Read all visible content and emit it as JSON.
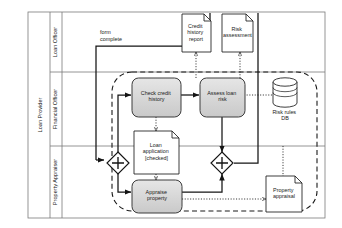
{
  "diagram": {
    "type": "bpmn-process-diagram",
    "pool": {
      "name": "Loan Provider"
    },
    "lanes": [
      {
        "id": "lane-loan-officer",
        "label": "Loan Officer"
      },
      {
        "id": "lane-financial-officer",
        "label": "Financial Officer"
      },
      {
        "id": "lane-property-appraiser",
        "label": "Property Appraiser"
      }
    ],
    "tasks": [
      {
        "id": "task-check-credit-history",
        "label": "Check credit history",
        "lane": "lane-financial-officer"
      },
      {
        "id": "task-assess-loan-risk",
        "label": "Assess loan risk",
        "lane": "lane-financial-officer"
      },
      {
        "id": "task-appraise-property",
        "label": "Appraise property",
        "lane": "lane-property-appraiser"
      }
    ],
    "data_objects": [
      {
        "id": "data-credit-history-report",
        "label": "Credit history report"
      },
      {
        "id": "data-risk-assessment",
        "label": "Risk assessment"
      },
      {
        "id": "data-loan-application-checked",
        "label": "Loan application [checked]"
      },
      {
        "id": "data-property-appraisal",
        "label": "Property appraisal"
      }
    ],
    "data_stores": [
      {
        "id": "datastore-risk-rules-db",
        "label": "Risk rules DB"
      }
    ],
    "gateways": [
      {
        "id": "gateway-parallel-split",
        "kind": "parallel",
        "symbol": "+"
      },
      {
        "id": "gateway-parallel-join",
        "kind": "parallel",
        "symbol": "+"
      }
    ],
    "flow_labels": [
      {
        "id": "flow-form-complete",
        "line1": "form",
        "line2": "complete"
      }
    ],
    "colors": {
      "task_fill": "#d9d9d9",
      "task_stroke": "#3d3d3d",
      "object_fill": "#ffffff",
      "object_stroke": "#1a1a1a",
      "lane_stroke": "#7a7a7a",
      "flow_stroke": "#1a1a1a",
      "group_stroke": "#1a1a1a",
      "background": "#ffffff"
    }
  }
}
